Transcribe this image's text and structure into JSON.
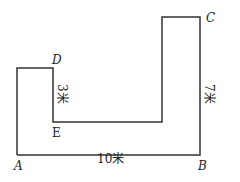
{
  "diagram": {
    "type": "geometry-figure",
    "points": {
      "A": "A",
      "B": "B",
      "C": "C",
      "D": "D",
      "E": "E"
    },
    "measurements": {
      "AB": "10米",
      "DE": "3米",
      "BC": "7米"
    },
    "colors": {
      "line": "#333333",
      "text": "#222222",
      "background": "#ffffff"
    }
  }
}
